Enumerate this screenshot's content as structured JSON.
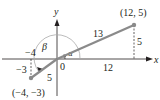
{
  "diagram": {
    "axes": {
      "x_label": "x",
      "y_label": "y",
      "origin_label": "0"
    },
    "points": [
      {
        "label": "(12, 5)",
        "x": 12,
        "y": 5
      },
      {
        "label": "(−4, −3)",
        "x": -4,
        "y": -3
      }
    ],
    "segments": [
      {
        "name": "hypotenuse-right",
        "length_label": "13"
      },
      {
        "name": "hypotenuse-left",
        "length_label": "5"
      }
    ],
    "legs": {
      "right_horizontal": "12",
      "right_vertical": "5",
      "left_horizontal": "−4",
      "left_vertical": "−3"
    },
    "angles": {
      "alpha": "α",
      "beta": "β"
    },
    "colors": {
      "segment": "#8a8a8a",
      "ink": "#231f20",
      "arc": "#aaaaaa"
    }
  }
}
